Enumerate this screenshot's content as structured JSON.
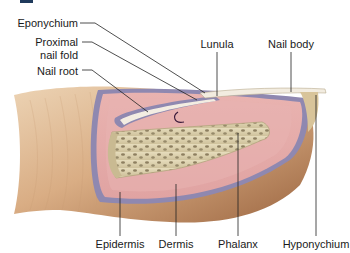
{
  "diagram": {
    "heading_marker_color": "#1f3a5c",
    "labels_left": [
      {
        "id": "eponychium",
        "text": "Eponychium"
      },
      {
        "id": "proximal-nail-fold",
        "line1": "Proximal",
        "line2": "nail fold"
      },
      {
        "id": "nail-root",
        "text": "Nail root"
      }
    ],
    "labels_top": [
      {
        "id": "lunula",
        "text": "Lunula"
      },
      {
        "id": "nail-body",
        "text": "Nail body"
      }
    ],
    "labels_bottom": [
      {
        "id": "epidermis",
        "text": "Epidermis"
      },
      {
        "id": "dermis",
        "text": "Dermis"
      },
      {
        "id": "phalanx",
        "text": "Phalanx"
      },
      {
        "id": "hyponychium",
        "text": "Hyponychium"
      }
    ],
    "colors": {
      "skin_light": "#e8c9a6",
      "skin_mid": "#d4a47a",
      "skin_dark": "#a8724a",
      "dermis_pink": "#e3a9a8",
      "dermis_light": "#eebfbc",
      "epidermis_band": "#8f88b0",
      "bone": "#d9cfae",
      "bone_spots": "#8a7d5e",
      "nail": "#f2ece0",
      "leader_line": "#222222"
    }
  }
}
